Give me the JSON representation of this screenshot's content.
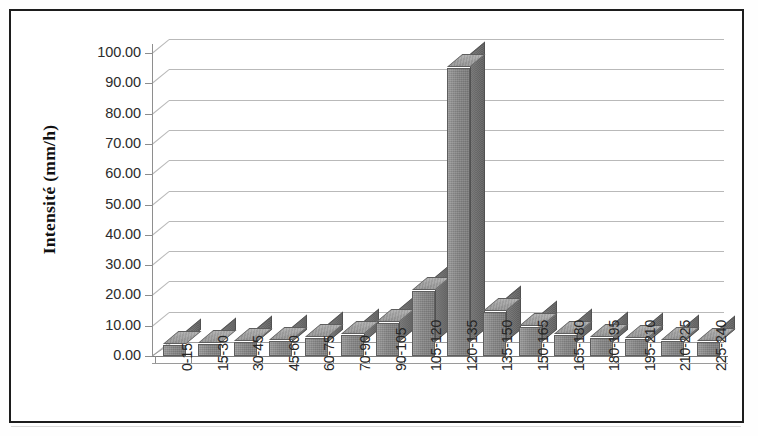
{
  "chart_data": {
    "type": "bar",
    "title": "",
    "subtitle": "",
    "xlabel": "",
    "ylabel": "Intensité (mm/h)",
    "ylim": [
      0,
      100
    ],
    "ytick_step": 10,
    "grid": true,
    "legend": "none",
    "style": "3d-column",
    "bar_color": "#8a8a8a",
    "categories": [
      "0-15",
      "15-30",
      "30-45",
      "45-60",
      "60-75",
      "70-90",
      "90-105",
      "105-120",
      "120-135",
      "135-150",
      "150-165",
      "165-180",
      "180-195",
      "195-210",
      "210-225",
      "225-240"
    ],
    "values": [
      3.5,
      4.0,
      4.5,
      5.0,
      6.0,
      7.0,
      11.0,
      21.5,
      95.0,
      14.5,
      9.5,
      7.0,
      6.0,
      5.5,
      5.0,
      4.5
    ],
    "ytick_labels": [
      "0.00",
      "10.00",
      "20.00",
      "30.00",
      "40.00",
      "50.00",
      "60.00",
      "70.00",
      "80.00",
      "90.00",
      "100.00"
    ],
    "ytick_values": [
      0,
      10,
      20,
      30,
      40,
      50,
      60,
      70,
      80,
      90,
      100
    ]
  },
  "figure": {
    "border_color": "#1d1d1d",
    "background": "#ffffff",
    "gridline_color": "#b9b9b9",
    "axis_color": "#8c8c8c"
  }
}
